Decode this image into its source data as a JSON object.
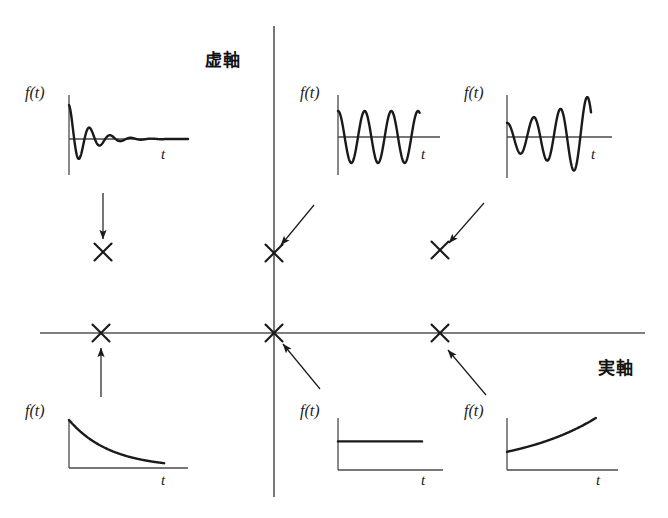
{
  "figure": {
    "kind": "s-plane-pole-response-diagram",
    "background_color": "#ffffff",
    "ink_color": "#1a1a1a",
    "axis_color": "#4a4a4a"
  },
  "axes": {
    "imaginary": {
      "label": "虚軸",
      "label_x": 205,
      "label_y": 46,
      "x": 274,
      "y_top": 26,
      "y_bottom": 497
    },
    "real": {
      "label": "実軸",
      "label_x": 598,
      "label_y": 354,
      "y": 333,
      "x_left": 40,
      "x_right": 645
    },
    "origin": {
      "x": 274,
      "y": 333
    }
  },
  "poles": [
    {
      "id": "pole-damped-oscillation",
      "x": 103,
      "y": 252,
      "desc": "複素左半平面の極"
    },
    {
      "id": "pole-undamped-oscillation",
      "x": 274,
      "y": 253,
      "desc": "虚軸上の極"
    },
    {
      "id": "pole-growing-oscillation",
      "x": 440,
      "y": 250,
      "desc": "複素右半平面の極"
    },
    {
      "id": "pole-exponential-decay",
      "x": 101,
      "y": 333,
      "desc": "実軸負の極"
    },
    {
      "id": "pole-constant",
      "x": 274,
      "y": 333,
      "desc": "原点の極"
    },
    {
      "id": "pole-exponential-growth",
      "x": 440,
      "y": 333,
      "desc": "実軸正の極"
    }
  ],
  "arrows": [
    {
      "id": "arrow-to-pole-damped-oscillation",
      "x1": 103,
      "y1": 193,
      "x2": 103,
      "y2": 239
    },
    {
      "id": "arrow-to-pole-undamped-oscillation",
      "x1": 314,
      "y1": 205,
      "x2": 281,
      "y2": 245
    },
    {
      "id": "arrow-to-pole-growing-oscillation",
      "x1": 484,
      "y1": 203,
      "x2": 449,
      "y2": 243
    },
    {
      "id": "arrow-to-pole-exponential-decay",
      "x1": 101,
      "y1": 397,
      "x2": 101,
      "y2": 348
    },
    {
      "id": "arrow-to-pole-constant",
      "x1": 320,
      "y1": 389,
      "x2": 283,
      "y2": 344
    },
    {
      "id": "arrow-to-pole-exponential-growth",
      "x1": 486,
      "y1": 395,
      "x2": 448,
      "y2": 350
    }
  ],
  "plots": [
    {
      "id": "plot-damped-oscillation",
      "kind": "damped-oscillation",
      "ylabel": "f(t)",
      "xlabel": "t",
      "box": {
        "left": 25,
        "top": 82,
        "width": 170,
        "height": 100
      },
      "ylabel_pos": {
        "x": 25,
        "y": 84
      },
      "xlabel_pos": {
        "x": 161,
        "y": 146
      },
      "axis": {
        "y_axis_x": 69,
        "y_axis_top": 95,
        "y_axis_bottom": 175,
        "x_axis_y": 139,
        "x_axis_right": 188
      },
      "chart_data": {
        "type": "line",
        "title": "f(t) 減衰振動",
        "xlabel": "t",
        "ylabel": "f(t)",
        "expression": "e^{-at} sin(wt), a>0",
        "amplitude_start": 1.0,
        "decay": 0.55,
        "cycles": 5
      }
    },
    {
      "id": "plot-undamped-oscillation",
      "kind": "sustained-oscillation",
      "ylabel": "f(t)",
      "xlabel": "t",
      "box": {
        "left": 298,
        "top": 82,
        "width": 150,
        "height": 100
      },
      "ylabel_pos": {
        "x": 300,
        "y": 84
      },
      "xlabel_pos": {
        "x": 421,
        "y": 146
      },
      "axis": {
        "y_axis_x": 338,
        "y_axis_top": 95,
        "y_axis_bottom": 175,
        "x_axis_y": 137,
        "x_axis_right": 440
      },
      "chart_data": {
        "type": "line",
        "title": "f(t) 持続振動",
        "xlabel": "t",
        "ylabel": "f(t)",
        "expression": "sin(wt)",
        "amplitude_start": 1.0,
        "decay": 0.0,
        "cycles": 3
      }
    },
    {
      "id": "plot-growing-oscillation",
      "kind": "growing-oscillation",
      "ylabel": "f(t)",
      "xlabel": "t",
      "box": {
        "left": 462,
        "top": 82,
        "width": 155,
        "height": 100
      },
      "ylabel_pos": {
        "x": 464,
        "y": 84
      },
      "xlabel_pos": {
        "x": 591,
        "y": 146
      },
      "axis": {
        "y_axis_x": 507,
        "y_axis_top": 95,
        "y_axis_bottom": 178,
        "x_axis_y": 137,
        "x_axis_right": 612
      },
      "chart_data": {
        "type": "line",
        "title": "f(t) 発散振動",
        "xlabel": "t",
        "ylabel": "f(t)",
        "expression": "e^{at} sin(wt), a>0",
        "amplitude_start": 0.35,
        "growth": 1.75,
        "cycles": 3
      }
    },
    {
      "id": "plot-exponential-decay",
      "kind": "exponential-decay",
      "ylabel": "f(t)",
      "xlabel": "t",
      "box": {
        "left": 25,
        "top": 400,
        "width": 170,
        "height": 90
      },
      "ylabel_pos": {
        "x": 25,
        "y": 402
      },
      "xlabel_pos": {
        "x": 161,
        "y": 472
      },
      "axis": {
        "y_axis_x": 69,
        "y_axis_top": 420,
        "y_axis_bottom": 468,
        "x_axis_y": 468,
        "x_axis_right": 188
      },
      "chart_data": {
        "type": "line",
        "title": "f(t) 指数減衰",
        "xlabel": "t",
        "ylabel": "f(t)",
        "expression": "e^{-at}, a>0",
        "y_start": 1.0,
        "y_end": 0.1
      }
    },
    {
      "id": "plot-constant",
      "kind": "constant",
      "ylabel": "f(t)",
      "xlabel": "t",
      "box": {
        "left": 298,
        "top": 400,
        "width": 150,
        "height": 90
      },
      "ylabel_pos": {
        "x": 300,
        "y": 402
      },
      "xlabel_pos": {
        "x": 421,
        "y": 472
      },
      "axis": {
        "y_axis_x": 338,
        "y_axis_top": 418,
        "y_axis_bottom": 470,
        "x_axis_y": 470,
        "x_axis_right": 443
      },
      "chart_data": {
        "type": "line",
        "title": "f(t) 一定値",
        "xlabel": "t",
        "ylabel": "f(t)",
        "expression": "1 (step)",
        "y_value": 0.55
      }
    },
    {
      "id": "plot-exponential-growth",
      "kind": "exponential-growth",
      "ylabel": "f(t)",
      "xlabel": "t",
      "box": {
        "left": 462,
        "top": 400,
        "width": 160,
        "height": 90
      },
      "ylabel_pos": {
        "x": 464,
        "y": 402
      },
      "xlabel_pos": {
        "x": 596,
        "y": 472
      },
      "axis": {
        "y_axis_x": 507,
        "y_axis_top": 418,
        "y_axis_bottom": 470,
        "x_axis_y": 470,
        "x_axis_right": 618
      },
      "chart_data": {
        "type": "line",
        "title": "f(t) 指数発散",
        "xlabel": "t",
        "ylabel": "f(t)",
        "expression": "e^{at}, a>0",
        "y_start": 0.35,
        "y_end": 1.0
      }
    }
  ]
}
